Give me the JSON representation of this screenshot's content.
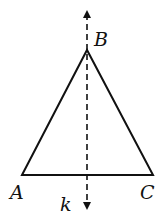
{
  "diagram": {
    "type": "isosceles-triangle-with-symmetry-axis",
    "stroke_color": "#111111",
    "points": {
      "A": {
        "label": "A",
        "x": 22,
        "y": 175
      },
      "B": {
        "label": "B",
        "x": 87,
        "y": 50
      },
      "C": {
        "label": "C",
        "x": 153,
        "y": 175
      }
    },
    "axis": {
      "label": "k",
      "x": 87,
      "y_top": 8,
      "y_bottom": 212,
      "style": "dashed",
      "arrows": "both"
    }
  }
}
